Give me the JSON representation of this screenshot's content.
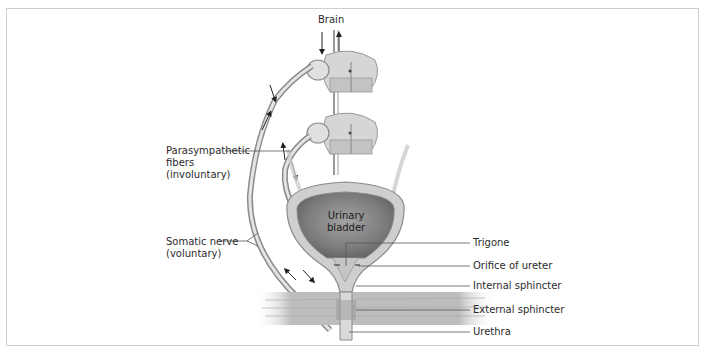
{
  "diagram": {
    "frame_color": "#cfcfcf",
    "colors": {
      "nerve": "#b8b8b8",
      "nerve_outline": "#8a8a8a",
      "bladder_wall": "#c9c9c9",
      "bladder_lumen": "#7d7d7d",
      "muscle": "#bdbdbd",
      "spinal_cord": "#d6d6d6",
      "leader_line": "#555555",
      "text": "#2b2b2b"
    },
    "labels": {
      "brain": "Brain",
      "parasympathetic": "Parasympathetic\nfibers\n(involuntary)",
      "somatic": "Somatic nerve\n(voluntary)",
      "bladder": "Urinary\nbladder",
      "trigone": "Trigone",
      "orifice_ureter": "Orifice of ureter",
      "internal_sphincter": "Internal sphincter",
      "external_sphincter": "External sphincter",
      "urethra": "Urethra"
    },
    "nodes": [
      {
        "id": "brain",
        "label": "Brain"
      },
      {
        "id": "spinal-cord-upper",
        "label": "Spinal cord segment (upper)"
      },
      {
        "id": "spinal-cord-lower",
        "label": "Spinal cord segment (lower)"
      },
      {
        "id": "parasympathetic",
        "label": "Parasympathetic fibers (involuntary)"
      },
      {
        "id": "somatic",
        "label": "Somatic nerve (voluntary)"
      },
      {
        "id": "bladder",
        "label": "Urinary bladder"
      },
      {
        "id": "trigone",
        "label": "Trigone"
      },
      {
        "id": "orifice",
        "label": "Orifice of ureter"
      },
      {
        "id": "internal-sphincter",
        "label": "Internal sphincter"
      },
      {
        "id": "external-sphincter",
        "label": "External sphincter"
      },
      {
        "id": "urethra",
        "label": "Urethra"
      }
    ],
    "edges": [
      {
        "from": "brain",
        "to": "spinal-cord-upper",
        "direction": "bidirectional"
      },
      {
        "from": "spinal-cord-lower",
        "to": "bladder",
        "via": "parasympathetic",
        "direction": "bidirectional"
      },
      {
        "from": "spinal-cord-upper",
        "to": "external-sphincter",
        "via": "somatic",
        "direction": "bidirectional"
      }
    ]
  }
}
